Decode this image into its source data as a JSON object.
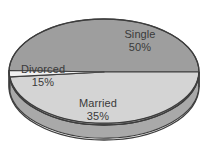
{
  "chart_data": {
    "type": "pie",
    "title": "",
    "subtitle": "",
    "xlabel": "",
    "ylabel": "",
    "legend": "none",
    "grid": false,
    "three_d": true,
    "value_unit": "%",
    "categories": [
      "Single",
      "Married",
      "Divorced"
    ],
    "values": [
      50,
      35,
      15
    ],
    "slices": [
      {
        "label": "Single",
        "value": 50,
        "value_text": "50%",
        "color": "#9e9e9e",
        "start_angle_deg": 0,
        "end_angle_deg": 180
      },
      {
        "label": "Married",
        "value": 35,
        "value_text": "35%",
        "color": "#d4d4d4",
        "start_angle_deg": 180,
        "end_angle_deg": 306
      },
      {
        "label": "Divorced",
        "value": 15,
        "value_text": "15%",
        "color": "#f1f1f1",
        "start_angle_deg": 306,
        "end_angle_deg": 360
      }
    ],
    "colors": {
      "single": "#9e9e9e",
      "married": "#d4d4d4",
      "divorced": "#f1f1f1",
      "single_side": "#7d7d7d",
      "married_side": "#a9a9a9",
      "divorced_side": "#c4c4c4",
      "outline": "#3d3d3d",
      "label_text": "#3a3a3a",
      "background": "#ffffff"
    },
    "geometry": {
      "center_x": 104,
      "center_y": 72,
      "radius_x": 95,
      "radius_y": 53,
      "depth": 15
    }
  }
}
